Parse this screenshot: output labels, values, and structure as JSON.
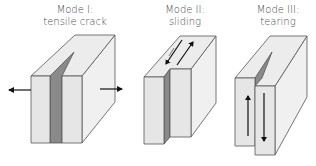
{
  "diagram": {
    "colors": {
      "front_face": "#e6e6e6",
      "top_face": "#ededed",
      "side_face": "#f0f0f0",
      "crack_face": "#8a8a8a",
      "edge": "#555555",
      "arrow": "#111111",
      "label_text": "#4a4a4a"
    },
    "modes": [
      {
        "id": "mode-1",
        "title": "Mode I:",
        "subtitle": "tensile crack",
        "arrows": [
          "left-outward",
          "right-outward"
        ]
      },
      {
        "id": "mode-2",
        "title": "Mode II:",
        "subtitle": "sliding",
        "arrows": [
          "down-left-on-top",
          "up-right-on-top"
        ]
      },
      {
        "id": "mode-3",
        "title": "Mode III:",
        "subtitle": "tearing",
        "arrows": [
          "up-on-front",
          "down-on-front"
        ]
      }
    ]
  }
}
